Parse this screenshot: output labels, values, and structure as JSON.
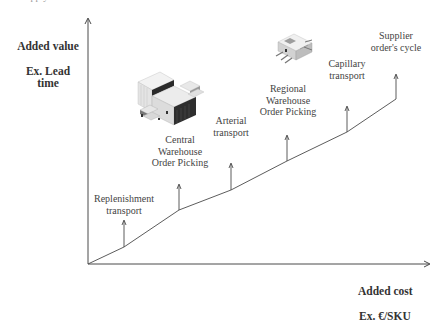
{
  "diagram": {
    "clipped_top_text": "Supply",
    "y_axis": {
      "line1": "Added value",
      "line2": "Ex. Lead time"
    },
    "x_axis": {
      "line1": "Added cost",
      "line2": "Ex. €/SKU"
    },
    "steps": [
      {
        "id": "replenishment",
        "label": "Replenishment\ntransport"
      },
      {
        "id": "central-warehouse",
        "label": "Central\nWarehouse\nOrder Picking"
      },
      {
        "id": "arterial",
        "label": "Arterial\ntransport"
      },
      {
        "id": "regional-warehouse",
        "label": "Regional\nWarehouse\nOrder Picking"
      },
      {
        "id": "capillary",
        "label": "Capillary\ntransport"
      },
      {
        "id": "supplier-cycle",
        "label": "Supplier\norder's cycle"
      }
    ],
    "icons": [
      {
        "name": "central-warehouse-building-icon"
      },
      {
        "name": "regional-warehouse-building-icon"
      }
    ],
    "colors": {
      "line": "#4a4a4a",
      "text": "#444444",
      "building_dark": "#2b2b2b",
      "building_light": "#e6e6e6"
    }
  }
}
